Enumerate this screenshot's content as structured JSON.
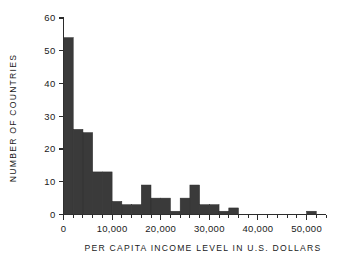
{
  "chart_data": {
    "type": "bar",
    "title": "",
    "subtitle": "",
    "xlabel": "PER CAPITA INCOME LEVEL IN U.S. DOLLARS",
    "ylabel": "NUMBER OF COUNTRIES",
    "xlim": [
      0,
      54000
    ],
    "ylim": [
      0,
      60
    ],
    "bin_width": 2000,
    "grid": false,
    "legend": null,
    "x_tick_labels": [
      "0",
      "10,000",
      "20,000",
      "30,000",
      "40,000",
      "50,000"
    ],
    "x_tick_values": [
      0,
      10000,
      20000,
      30000,
      40000,
      50000
    ],
    "x_minor_tick_step": 2000,
    "y_tick_labels": [
      "0",
      "10",
      "20",
      "30",
      "40",
      "50",
      "60"
    ],
    "y_tick_values": [
      0,
      10,
      20,
      30,
      40,
      50,
      60
    ],
    "categories": [
      "0-2,000",
      "2,000-4,000",
      "4,000-6,000",
      "6,000-8,000",
      "8,000-10,000",
      "10,000-12,000",
      "12,000-14,000",
      "14,000-16,000",
      "16,000-18,000",
      "18,000-20,000",
      "20,000-22,000",
      "22,000-24,000",
      "24,000-26,000",
      "26,000-28,000",
      "28,000-30,000",
      "30,000-32,000",
      "32,000-34,000",
      "34,000-36,000",
      "36,000-38,000",
      "38,000-40,000",
      "40,000-42,000",
      "42,000-44,000",
      "44,000-46,000",
      "46,000-48,000",
      "48,000-50,000",
      "50,000-52,000"
    ],
    "bins": [
      {
        "x0": 0,
        "x1": 2000,
        "value": 54
      },
      {
        "x0": 2000,
        "x1": 4000,
        "value": 26
      },
      {
        "x0": 4000,
        "x1": 6000,
        "value": 25
      },
      {
        "x0": 6000,
        "x1": 8000,
        "value": 13
      },
      {
        "x0": 8000,
        "x1": 10000,
        "value": 13
      },
      {
        "x0": 10000,
        "x1": 12000,
        "value": 4
      },
      {
        "x0": 12000,
        "x1": 14000,
        "value": 3
      },
      {
        "x0": 14000,
        "x1": 16000,
        "value": 3
      },
      {
        "x0": 16000,
        "x1": 18000,
        "value": 9
      },
      {
        "x0": 18000,
        "x1": 20000,
        "value": 5
      },
      {
        "x0": 20000,
        "x1": 22000,
        "value": 5
      },
      {
        "x0": 22000,
        "x1": 24000,
        "value": 1
      },
      {
        "x0": 24000,
        "x1": 26000,
        "value": 5
      },
      {
        "x0": 26000,
        "x1": 28000,
        "value": 9
      },
      {
        "x0": 28000,
        "x1": 30000,
        "value": 3
      },
      {
        "x0": 30000,
        "x1": 32000,
        "value": 3
      },
      {
        "x0": 32000,
        "x1": 34000,
        "value": 1
      },
      {
        "x0": 34000,
        "x1": 36000,
        "value": 2
      },
      {
        "x0": 36000,
        "x1": 38000,
        "value": 0
      },
      {
        "x0": 38000,
        "x1": 40000,
        "value": 0
      },
      {
        "x0": 40000,
        "x1": 42000,
        "value": 0
      },
      {
        "x0": 42000,
        "x1": 44000,
        "value": 0
      },
      {
        "x0": 44000,
        "x1": 46000,
        "value": 0
      },
      {
        "x0": 46000,
        "x1": 48000,
        "value": 0
      },
      {
        "x0": 48000,
        "x1": 50000,
        "value": 0
      },
      {
        "x0": 50000,
        "x1": 52000,
        "value": 1
      }
    ],
    "values": [
      54,
      26,
      25,
      13,
      13,
      4,
      3,
      3,
      9,
      5,
      5,
      1,
      5,
      9,
      3,
      3,
      1,
      2,
      0,
      0,
      0,
      0,
      0,
      0,
      0,
      1
    ],
    "colors": {
      "bar_fill": "#3a3a3a",
      "axis": "#2b2b2b",
      "text": "#1a1a1a",
      "background": "#ffffff"
    }
  }
}
